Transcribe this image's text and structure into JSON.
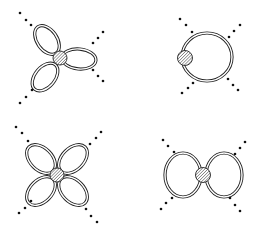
{
  "figure": {
    "width": 260,
    "height": 231,
    "background": "#ffffff",
    "stroke_color": "#222222",
    "dot_color": "#111111",
    "hatch_color": "#333333",
    "blob_fill": "#d8d8d8"
  },
  "diagrams": [
    {
      "id": "three-loop-vertex",
      "position": "top-left",
      "blob": {
        "cx": 60,
        "cy": 58,
        "r": 7
      },
      "loops": [
        {
          "cx": 47,
          "cy": 40,
          "rx": 10,
          "ry": 16,
          "rotate": -35
        },
        {
          "cx": 79,
          "cy": 59,
          "rx": 17,
          "ry": 10,
          "rotate": 5
        },
        {
          "cx": 45,
          "cy": 77,
          "rx": 10,
          "ry": 16,
          "rotate": 40
        }
      ],
      "dot_rows": [
        [
          [
            20,
            13
          ],
          [
            26,
            20
          ],
          [
            31,
            25
          ]
        ],
        [
          [
            20,
            103
          ],
          [
            26,
            97
          ],
          [
            32,
            90
          ]
        ],
        [
          [
            103,
            32
          ],
          [
            98,
            38
          ],
          [
            93,
            43
          ]
        ],
        [
          [
            93,
            70
          ],
          [
            98,
            76
          ],
          [
            103,
            81
          ]
        ]
      ]
    },
    {
      "id": "single-large-loop",
      "position": "top-right",
      "blob": {
        "cx": 185,
        "cy": 58,
        "r": 7.5
      },
      "loops": [
        {
          "cx": 207,
          "cy": 57,
          "rx": 25,
          "ry": 24,
          "rotate": 0
        }
      ],
      "dot_rows": [
        [
          [
            180,
            19
          ],
          [
            186,
            25
          ],
          [
            192,
            32
          ]
        ],
        [
          [
            240,
            25
          ],
          [
            234,
            31
          ],
          [
            229,
            37
          ]
        ],
        [
          [
            182,
            93
          ],
          [
            188,
            88
          ],
          [
            193,
            83
          ]
        ],
        [
          [
            228,
            79
          ],
          [
            233,
            85
          ],
          [
            238,
            90
          ]
        ]
      ]
    },
    {
      "id": "four-loop-vertex",
      "position": "bottom-left",
      "blob": {
        "cx": 57,
        "cy": 175,
        "r": 7
      },
      "loops": [
        {
          "cx": 41,
          "cy": 159,
          "rx": 11,
          "ry": 17,
          "rotate": -45
        },
        {
          "cx": 73,
          "cy": 159,
          "rx": 11,
          "ry": 17,
          "rotate": 45
        },
        {
          "cx": 41,
          "cy": 191,
          "rx": 11,
          "ry": 17,
          "rotate": 45
        },
        {
          "cx": 73,
          "cy": 191,
          "rx": 11,
          "ry": 17,
          "rotate": -45
        }
      ],
      "dot_rows": [
        [
          [
            16,
            127
          ],
          [
            22,
            133
          ],
          [
            28,
            141
          ]
        ],
        [
          [
            101,
            132
          ],
          [
            96,
            138
          ],
          [
            90,
            144
          ]
        ],
        [
          [
            19,
            213
          ],
          [
            25,
            208
          ],
          [
            31,
            201
          ]
        ],
        [
          [
            86,
            209
          ],
          [
            91,
            216
          ],
          [
            97,
            222
          ]
        ]
      ]
    },
    {
      "id": "two-loop-vertex",
      "position": "bottom-right",
      "blob": {
        "cx": 203,
        "cy": 175,
        "r": 7.5
      },
      "loops": [
        {
          "cx": 183,
          "cy": 175,
          "rx": 18,
          "ry": 22,
          "rotate": 0
        },
        {
          "cx": 224,
          "cy": 175,
          "rx": 18,
          "ry": 22,
          "rotate": 0
        }
      ],
      "dot_rows": [
        [
          [
            163,
            140
          ],
          [
            168,
            146
          ],
          [
            174,
            152
          ]
        ],
        [
          [
            245,
            142
          ],
          [
            240,
            148
          ],
          [
            235,
            154
          ]
        ],
        [
          [
            161,
            209
          ],
          [
            166,
            203
          ],
          [
            172,
            198
          ]
        ],
        [
          [
            230,
            198
          ],
          [
            235,
            205
          ],
          [
            240,
            211
          ]
        ]
      ]
    }
  ]
}
